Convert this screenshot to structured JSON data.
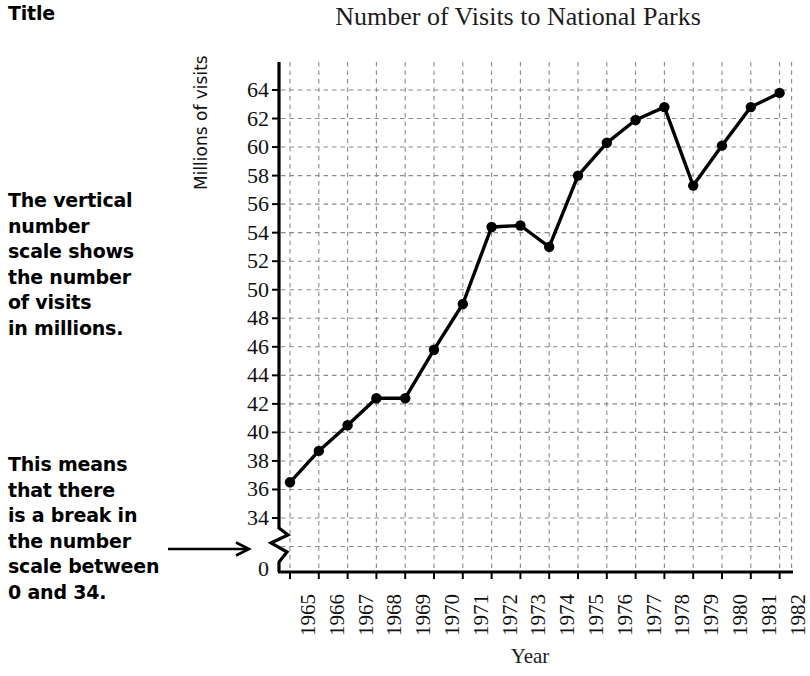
{
  "annotations": {
    "title_label": "Title",
    "note_scale": "The vertical\nnumber\nscale shows\nthe number\nof visits\nin millions.",
    "note_break": "This means\nthat there\nis a break in\nthe number\nscale between\n0 and 34.",
    "arrow_icon": "arrow-right-icon"
  },
  "chart_data": {
    "type": "line",
    "title": "Number of Visits to National Parks",
    "xlabel": "Year",
    "ylabel": "Millions of visits",
    "categories": [
      "1965",
      "1966",
      "1967",
      "1968",
      "1969",
      "1970",
      "1971",
      "1972",
      "1973",
      "1974",
      "1975",
      "1976",
      "1977",
      "1978",
      "1979",
      "1980",
      "1981",
      "1982"
    ],
    "values": [
      36.5,
      38.7,
      40.5,
      42.4,
      42.4,
      45.8,
      49.0,
      54.4,
      54.5,
      53.0,
      58.0,
      60.3,
      61.9,
      62.8,
      57.3,
      60.1,
      62.8,
      63.8
    ],
    "ylim": [
      34,
      65
    ],
    "yticks": [
      64,
      62,
      60,
      58,
      56,
      54,
      52,
      50,
      48,
      46,
      44,
      42,
      40,
      38,
      36,
      34
    ],
    "ytick_zero": "0",
    "axis_break": true,
    "grid": true,
    "legend": "none",
    "series_color": "#000000",
    "grid_color": "#8a8a8a"
  }
}
